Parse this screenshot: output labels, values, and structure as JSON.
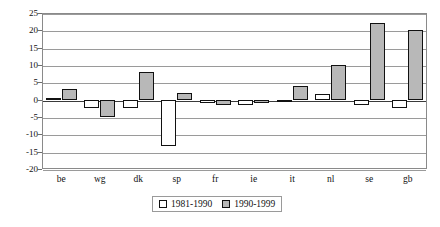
{
  "chart_data": {
    "type": "bar",
    "title": "",
    "xlabel": "",
    "ylabel": "",
    "ylim": [
      -20,
      25
    ],
    "ytick_step": 5,
    "yticks": [
      25,
      20,
      15,
      10,
      5,
      0,
      -5,
      -10,
      -15,
      -20
    ],
    "grid": true,
    "legend_position": "bottom-center",
    "categories": [
      "be",
      "wg",
      "dk",
      "sp",
      "fr",
      "ie",
      "it",
      "nl",
      "se",
      "gb"
    ],
    "series": [
      {
        "name": "1981-1990",
        "color": "#ffffff",
        "values": [
          0.5,
          -2.5,
          -2.5,
          -13.5,
          -1,
          -1.5,
          -0.5,
          1.5,
          -1.5,
          -2.5
        ]
      },
      {
        "name": "1990-1999",
        "color": "#b8b8b8",
        "values": [
          3,
          -5,
          8,
          2,
          -1.5,
          -1,
          4,
          10,
          22,
          20
        ]
      }
    ]
  }
}
